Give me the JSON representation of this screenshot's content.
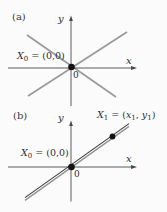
{
  "figure": {
    "background": "#fbfbfb",
    "colors": {
      "axis": "#4a4a4a",
      "gray_line": "#9b9b9b",
      "double_line_dark": "#3d3d3d",
      "double_line_light": "#929292",
      "dot": "#141414",
      "text": "#2e2e2e"
    }
  },
  "panel_a": {
    "tag": "(a)",
    "x_axis_label": "x",
    "y_axis_label": "y",
    "origin_tick_label": "0",
    "point_label": {
      "var": "X",
      "sub": "0",
      "rest": " = (0,0)"
    }
  },
  "panel_b": {
    "tag": "(b)",
    "x_axis_label": "x",
    "y_axis_label": "y",
    "origin_tick_label": "0",
    "origin_point_label": {
      "var": "X",
      "sub": "0",
      "rest": " = (0,0)"
    },
    "point_label": {
      "var": "X",
      "sub": "1",
      "eq": " = (",
      "x_var": "x",
      "x_sub": "1",
      "sep": ", ",
      "y_var": "y",
      "y_sub": "1",
      "close": ")"
    }
  }
}
